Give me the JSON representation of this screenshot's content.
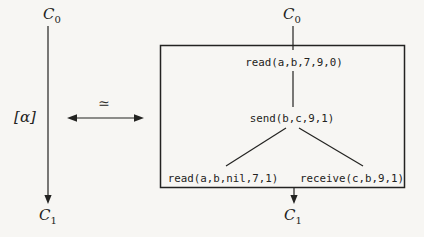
{
  "colors": {
    "background": "#f7f6f3",
    "ink": "#232321"
  },
  "labels": {
    "config_base": "C",
    "sub_initial": "0",
    "sub_final": "1"
  },
  "left_transition": {
    "action_label": "[α]"
  },
  "equivalence": {
    "symbol": "≃"
  },
  "trace_box": {
    "root_event": "read(a,b,7,9,0)",
    "middle_event": "send(b,c,9,1)",
    "left_leaf_event": "read(a,b,nil,7,1)",
    "right_leaf_event": "receive(c,b,9,1)"
  }
}
